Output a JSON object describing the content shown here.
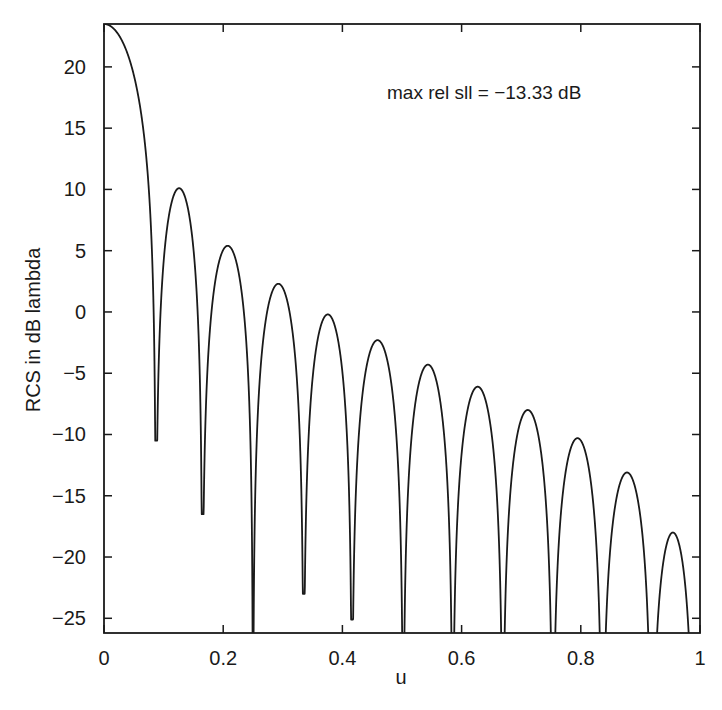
{
  "chart_data": {
    "type": "line",
    "title": "",
    "xlabel": "u",
    "ylabel": "RCS in dB lambda",
    "xlim": [
      0,
      1
    ],
    "ylim": [
      -26.2,
      23.5
    ],
    "grid": false,
    "legend": null,
    "xticks": [
      0,
      0.2,
      0.4,
      0.6,
      0.8,
      1
    ],
    "xtick_labels": [
      "0",
      "0.2",
      "0.4",
      "0.6",
      "0.8",
      "1"
    ],
    "yticks": [
      20,
      15,
      10,
      5,
      0,
      -5,
      -10,
      -15,
      -20,
      -25
    ],
    "ytick_labels": [
      "20",
      "15",
      "10",
      "5",
      "0",
      "−10",
      "−5"
    ],
    "ytick_labels_ordered": [
      "20",
      "15",
      "10",
      "5",
      "0",
      "−5",
      "−10",
      "−15",
      "−20",
      "−25"
    ],
    "annotation": "max rel sll = −13.33 dB",
    "mainlobe_peak": {
      "u": 0.0,
      "db": 23.5
    },
    "null_spacing_u": 0.0836,
    "sidelobe_peaks": [
      {
        "u": 0.121,
        "db": 10.1
      },
      {
        "u": 0.204,
        "db": 5.4
      },
      {
        "u": 0.289,
        "db": 2.3
      },
      {
        "u": 0.373,
        "db": -0.2
      },
      {
        "u": 0.456,
        "db": -2.3
      },
      {
        "u": 0.539,
        "db": -4.3
      },
      {
        "u": 0.622,
        "db": -6.1
      },
      {
        "u": 0.706,
        "db": -8.0
      },
      {
        "u": 0.79,
        "db": -10.3
      },
      {
        "u": 0.872,
        "db": -13.1
      },
      {
        "u": 0.953,
        "db": -18.0
      }
    ],
    "null_floors": [
      {
        "u": 0.087,
        "db": -10.5
      },
      {
        "u": 0.165,
        "db": -16.5
      },
      {
        "u": 0.25,
        "db": -30
      },
      {
        "u": 0.335,
        "db": -23.0
      },
      {
        "u": 0.416,
        "db": -25.1
      },
      {
        "u": 0.502,
        "db": -30
      },
      {
        "u": 0.585,
        "db": -30
      },
      {
        "u": 0.669,
        "db": -30
      },
      {
        "u": 0.753,
        "db": -30
      },
      {
        "u": 0.836,
        "db": -30
      },
      {
        "u": 0.919,
        "db": -30
      },
      {
        "u": 0.99,
        "db": -30
      }
    ]
  },
  "plot": {
    "annotation_text": "max rel sll = −13.33 dB",
    "xlabel": "u",
    "ylabel": "RCS in dB lambda"
  }
}
